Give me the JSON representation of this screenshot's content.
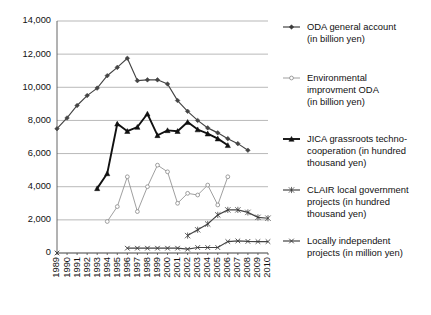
{
  "chart_data": {
    "type": "line",
    "title": "",
    "xlabel": "",
    "ylabel": "",
    "grid": "horizontal",
    "legend_position": "right",
    "ylim": [
      0,
      14000
    ],
    "ytick_labels": [
      "14,000",
      "12,000",
      "10,000",
      "8,000",
      "6,000",
      "4,000",
      "2,000",
      "0"
    ],
    "ytick_values": [
      14000,
      12000,
      10000,
      8000,
      6000,
      4000,
      2000,
      0
    ],
    "x": [
      1989,
      1990,
      1991,
      1992,
      1993,
      1994,
      1995,
      1996,
      1997,
      1998,
      1999,
      2000,
      2001,
      2002,
      2003,
      2004,
      2005,
      2006,
      2007,
      2008,
      2009,
      2010
    ],
    "xtick_labels": [
      "1989",
      "1990",
      "1991",
      "1992",
      "1993",
      "1994",
      "1995",
      "1996",
      "1997",
      "1998",
      "1999",
      "2000",
      "2001",
      "2002",
      "2003",
      "2004",
      "2005",
      "2006",
      "2007",
      "2008",
      "2009",
      "2010"
    ],
    "series": [
      {
        "name": "ODA general account (in billion yen)",
        "marker": "diamond",
        "style": "mid",
        "color": "#444444",
        "values": [
          7500,
          8150,
          8900,
          9500,
          9950,
          10700,
          11200,
          11750,
          10400,
          10450,
          10450,
          10200,
          9200,
          8550,
          8000,
          7550,
          7250,
          6900,
          6600,
          6200,
          null,
          null
        ]
      },
      {
        "name": "Environmental improvment ODA (in billion yen)",
        "marker": "circle",
        "style": "light",
        "color": "#8e8e8e",
        "values": [
          null,
          null,
          null,
          null,
          null,
          1900,
          2800,
          4600,
          2500,
          4000,
          5300,
          4900,
          3000,
          3600,
          3500,
          4100,
          2900,
          4600,
          null,
          null,
          null,
          null
        ]
      },
      {
        "name": "JICA grassroots techno-cooperation (in hundred thousand yen)",
        "marker": "triangle",
        "style": "bold",
        "color": "#111111",
        "values": [
          null,
          null,
          null,
          null,
          3900,
          4800,
          7800,
          7350,
          7600,
          8400,
          7100,
          7400,
          7350,
          7900,
          7450,
          7200,
          6900,
          6500,
          null,
          null,
          null,
          null
        ]
      },
      {
        "name": "CLAIR local government projects (in hundred thousand yen)",
        "marker": "star",
        "style": "mid",
        "color": "#3a3a3a",
        "values": [
          null,
          null,
          null,
          null,
          null,
          null,
          null,
          null,
          null,
          null,
          null,
          null,
          null,
          1050,
          1400,
          1750,
          2300,
          2600,
          2600,
          2450,
          2150,
          2100
        ]
      },
      {
        "name": "Locally independent projects (in million yen)",
        "marker": "cross",
        "style": "mid",
        "color": "#3a3a3a",
        "values": [
          0,
          null,
          null,
          null,
          null,
          null,
          null,
          290,
          290,
          290,
          290,
          290,
          290,
          230,
          330,
          330,
          330,
          690,
          730,
          700,
          690,
          690
        ]
      }
    ]
  },
  "legend": {
    "entries": [
      {
        "marker": "diamond",
        "style": "mid",
        "lines": [
          "ODA general account",
          "(in billion yen)"
        ]
      },
      {
        "marker": "circle",
        "style": "light",
        "lines": [
          "Environmental",
          "improvment ODA",
          "(in billion yen)"
        ]
      },
      {
        "marker": "triangle",
        "style": "bold",
        "lines": [
          "JICA grassroots techno-",
          "cooperation (in hundred",
          "thousand yen)"
        ]
      },
      {
        "marker": "star",
        "style": "mid",
        "lines": [
          "CLAIR local government",
          "projects (in hundred",
          "thousand yen)"
        ]
      },
      {
        "marker": "cross",
        "style": "mid",
        "lines": [
          "Locally independent",
          "projects (in million yen)"
        ]
      }
    ]
  }
}
